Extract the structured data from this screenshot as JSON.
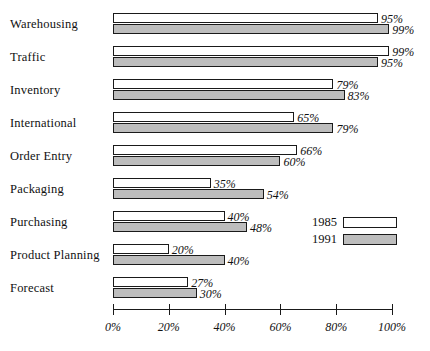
{
  "chart_data": {
    "type": "bar",
    "orientation": "horizontal",
    "title": "",
    "subtitle": "",
    "xlabel": "",
    "ylabel": "",
    "xlim": [
      0,
      100
    ],
    "grid": false,
    "legend_position": "middle-right",
    "value_suffix": "%",
    "categories": [
      "Warehousing",
      "Traffic",
      "Inventory",
      "International",
      "Order Entry",
      "Packaging",
      "Purchasing",
      "Product Planning",
      "Forecast"
    ],
    "series": [
      {
        "name": "1985",
        "color": "#ffffff",
        "values": [
          95,
          99,
          79,
          65,
          66,
          35,
          40,
          20,
          27
        ],
        "labels": [
          "95%",
          "99%",
          "79%",
          "65%",
          "66%",
          "35%",
          "40%",
          "20%",
          "27%"
        ]
      },
      {
        "name": "1991",
        "color": "#bdbdbd",
        "values": [
          99,
          95,
          83,
          79,
          60,
          54,
          48,
          40,
          30
        ],
        "labels": [
          "99%",
          "95%",
          "83%",
          "79%",
          "60%",
          "54%",
          "48%",
          "40%",
          "30%"
        ]
      }
    ],
    "xticks": [
      0,
      20,
      40,
      60,
      80,
      100
    ],
    "xtick_labels": [
      "0%",
      "20%",
      "40%",
      "60%",
      "80%",
      "100%"
    ]
  },
  "legend": {
    "entries": [
      {
        "label": "1985",
        "swatch": "white"
      },
      {
        "label": "1991",
        "swatch": "gray"
      }
    ]
  },
  "colors": {
    "series_1985": "#ffffff",
    "series_1991": "#bdbdbd",
    "outline": "#1a1a1a",
    "background": "#ffffff",
    "text": "#111111"
  }
}
